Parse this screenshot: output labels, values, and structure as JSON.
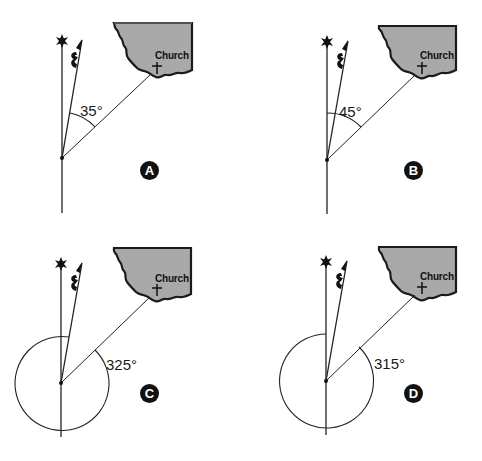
{
  "figure": {
    "colors": {
      "ink": "#1a1a1a",
      "map_fill": "#a9a9a9",
      "map_edge": "#1b1b1b",
      "badge": "#111111"
    },
    "panels": [
      {
        "id": "A",
        "badge": "A",
        "angle_label": "35°",
        "angle_degrees": 35,
        "arc_type": "from-magnetic-to-church",
        "church_label": "Church",
        "offset": [
          0,
          0
        ]
      },
      {
        "id": "B",
        "badge": "B",
        "angle_label": "45°",
        "angle_degrees": 45,
        "arc_type": "from-true-to-church",
        "church_label": "Church",
        "offset": [
          241,
          0
        ]
      },
      {
        "id": "C",
        "badge": "C",
        "angle_label": "325°",
        "angle_degrees": 325,
        "arc_type": "full-circle-from-church-to-magnetic",
        "church_label": "Church",
        "offset": [
          0,
          230
        ]
      },
      {
        "id": "D",
        "badge": "D",
        "angle_label": "315°",
        "angle_degrees": 315,
        "arc_type": "full-circle-from-church-to-true",
        "church_label": "Church",
        "offset": [
          241,
          230
        ]
      }
    ],
    "symbols": {
      "true_north": "star-icon",
      "magnetic_north": "fleur-arrow-icon",
      "church": "cross-icon"
    }
  }
}
